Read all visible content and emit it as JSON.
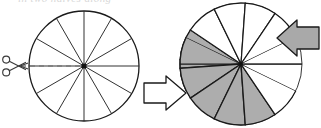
{
  "figure": {
    "clipped_caption_text": "in two halves along"
  },
  "colors": {
    "background": "#ffffff",
    "outline": "#1a1a1a",
    "thin_outline": "#3a3a3a",
    "sector_fill_light": "#ffffff",
    "sector_fill_shaded": "#adadad",
    "arrow_fill_gray": "#a9a9a9",
    "arrow_fill_white": "#ffffff",
    "arrow_outline": "#1a1a1a",
    "dashed_cut_line": "#7a7a7a",
    "center_dot": "#111111",
    "caption_text": "#b8b8b8"
  },
  "left_figure": {
    "name": "circle-with-cut-line",
    "center": {
      "x": 84,
      "y": 66
    },
    "radius": 55,
    "sector_count": 12,
    "sector_angle_degrees": 30,
    "sector_fill": "white",
    "cut_line": {
      "style": "dashed",
      "from_x": 22,
      "to_x": 84,
      "y": 66,
      "dash_pattern": "5 4"
    },
    "center_dot_radius": 2.6,
    "scissors": {
      "name": "scissors-icon",
      "x": 14,
      "y": 66,
      "size": 20,
      "meaning": "cut"
    }
  },
  "right_figure": {
    "name": "rearranged-sectors",
    "center": {
      "x": 241,
      "y": 64
    },
    "radius": 61,
    "sector_count": 12,
    "sector_angle_degrees": 30,
    "base_circle_outline": true,
    "top_fan": {
      "name": "upper-sector-fan",
      "rotation_offset_degrees": -26,
      "sector_count": 6,
      "shaded_count": 2,
      "light_count": 4
    },
    "bottom_fan": {
      "name": "lower-sector-fan",
      "rotation_offset_degrees": 26,
      "sector_count": 6,
      "shaded_count": 5,
      "light_count": 1
    },
    "arrows": [
      {
        "name": "arrow-upper-right",
        "direction": "left",
        "fill": "gray",
        "x": 265,
        "y": 38,
        "length": 54,
        "meaning": "slide upper sectors left"
      },
      {
        "name": "arrow-lower-left",
        "direction": "right",
        "fill": "white",
        "x": 155,
        "y": 92,
        "length": 48,
        "meaning": "slide lower sectors right"
      }
    ]
  }
}
